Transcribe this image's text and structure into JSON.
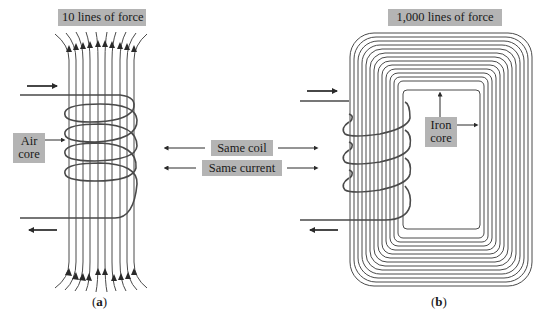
{
  "figure": {
    "panel_a": {
      "title": "10 lines of force",
      "core_label_line1": "Air",
      "core_label_line2": "core",
      "caption_open": "(",
      "caption_letter": "a",
      "caption_close": ")",
      "field_line_count": 10
    },
    "panel_b": {
      "title": "1,000 lines of force",
      "core_label_line1": "Iron",
      "core_label_line2": "core",
      "caption_open": "(",
      "caption_letter": "b",
      "caption_close": ")",
      "field_line_count": 14
    },
    "shared_labels": {
      "same_coil": "Same coil",
      "same_current": "Same current"
    },
    "colors": {
      "line": "#4a4a4a",
      "label_bg": "#b4b4b4",
      "text": "#1a1a1a"
    }
  }
}
